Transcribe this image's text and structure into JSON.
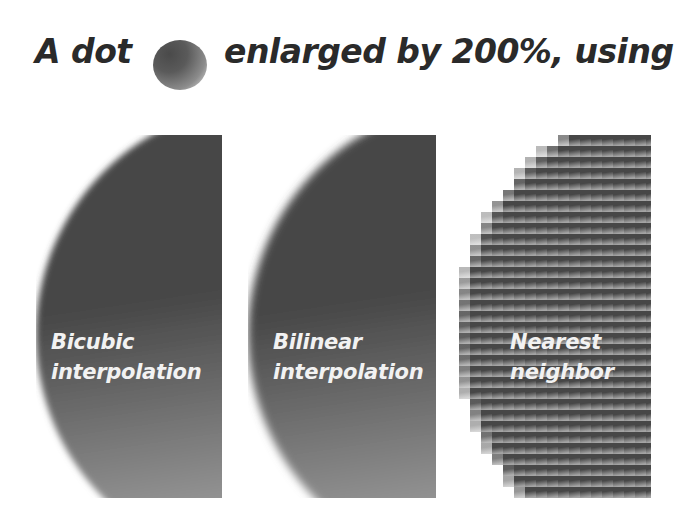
{
  "title": {
    "part1": "A dot",
    "part2": "enlarged by 200%, using"
  },
  "sample_dot": {
    "icon": "gradient-dot",
    "colors": [
      "#4a4a4a",
      "#e6e6e6"
    ]
  },
  "panels": [
    {
      "id": "bicubic",
      "line1": "Bicubic",
      "line2": "interpolation",
      "edge": "smooth"
    },
    {
      "id": "bilinear",
      "line1": "Bilinear",
      "line2": "interpolation",
      "edge": "smooth"
    },
    {
      "id": "nearest",
      "line1": "Nearest",
      "line2": "neighbor",
      "edge": "stepped"
    }
  ],
  "colors": {
    "dark": "#474747",
    "light": "#a4a4a4",
    "text": "#f2f2f2",
    "title": "#2a2a2a"
  }
}
